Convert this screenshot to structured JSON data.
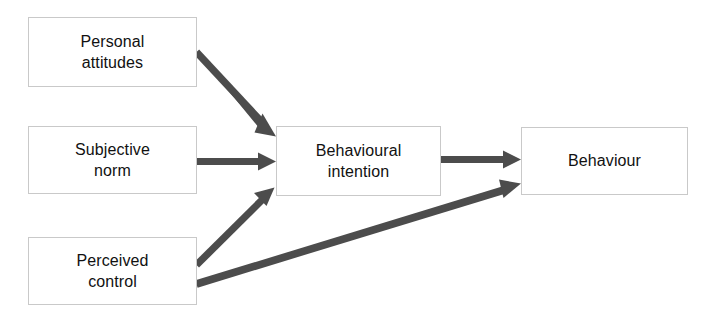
{
  "diagram": {
    "background_color": "#ffffff",
    "arrow_color": "#4c4c4c",
    "box_border_color": "#c9c9c9",
    "text_color": "#111111",
    "nodes": [
      {
        "id": "personal-attitudes",
        "label": "Personal\nattitudes",
        "line1": "Personal",
        "line2": "attitudes"
      },
      {
        "id": "subjective-norm",
        "label": "Subjective\nnorm",
        "line1": "Subjective",
        "line2": "norm"
      },
      {
        "id": "perceived-control",
        "label": "Perceived\ncontrol",
        "line1": "Perceived",
        "line2": "control"
      },
      {
        "id": "behavioural-intention",
        "label": "Behavioural\nintention",
        "line1": "Behavioural",
        "line2": "intention"
      },
      {
        "id": "behaviour",
        "label": "Behaviour",
        "line1": "Behaviour",
        "line2": ""
      }
    ],
    "edges": [
      {
        "id": "attitudes-to-intention",
        "from": "personal-attitudes",
        "to": "behavioural-intention",
        "style": "solid-arrow"
      },
      {
        "id": "norm-to-intention",
        "from": "subjective-norm",
        "to": "behavioural-intention",
        "style": "solid-arrow"
      },
      {
        "id": "control-to-intention",
        "from": "perceived-control",
        "to": "behavioural-intention",
        "style": "solid-arrow"
      },
      {
        "id": "control-to-behaviour",
        "from": "perceived-control",
        "to": "behaviour",
        "style": "solid-arrow"
      },
      {
        "id": "intention-to-behaviour",
        "from": "behavioural-intention",
        "to": "behaviour",
        "style": "solid-arrow"
      }
    ]
  }
}
